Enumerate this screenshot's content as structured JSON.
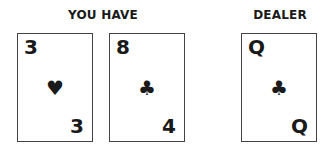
{
  "player": {
    "label": "YOU HAVE",
    "cards": [
      {
        "rank_top": "3",
        "suit": "♥",
        "suit_name": "hearts",
        "rank_bottom": "3"
      },
      {
        "rank_top": "8",
        "suit": "♣",
        "suit_name": "clubs",
        "rank_bottom": "4"
      }
    ]
  },
  "dealer": {
    "label": "DEALER",
    "cards": [
      {
        "rank_top": "Q",
        "suit": "♣",
        "suit_name": "clubs",
        "rank_bottom": "Q"
      }
    ]
  }
}
